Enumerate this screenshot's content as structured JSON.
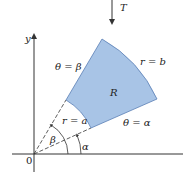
{
  "figure": {
    "type": "polar-region-diagram",
    "colors": {
      "region_fill": "#a8c4e6",
      "region_stroke": "#5a7fb5",
      "axis": "#333333",
      "text": "#222222"
    },
    "labels": {
      "transform": "T",
      "y_axis": "y",
      "origin": "0",
      "region": "R",
      "outer_radius": "r = b",
      "inner_radius": "r = a",
      "upper_ray": "θ = β",
      "lower_ray": "θ = α",
      "angle_beta": "β",
      "angle_alpha": "α"
    }
  }
}
